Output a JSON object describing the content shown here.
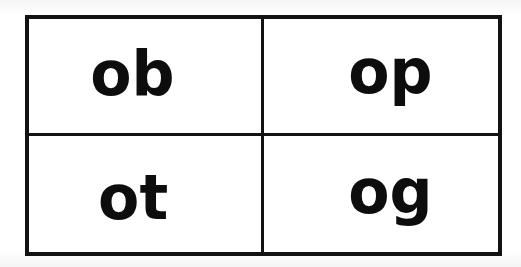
{
  "document": {
    "title": "Phonics rime grid",
    "kind": "flashcard-grid",
    "background_color": "#ffffff",
    "ink_color": "#121212"
  },
  "grid": {
    "columns": 2,
    "rows": 2,
    "outer_border_color": "#121212",
    "outer_border_width_px": 4,
    "inner_divider_color": "#121212",
    "inner_divider_width_px": 3,
    "cells": [
      {
        "position": "top-left",
        "text": "ob"
      },
      {
        "position": "top-right",
        "text": "op"
      },
      {
        "position": "bottom-left",
        "text": "ot"
      },
      {
        "position": "bottom-right",
        "text": "og"
      }
    ]
  }
}
